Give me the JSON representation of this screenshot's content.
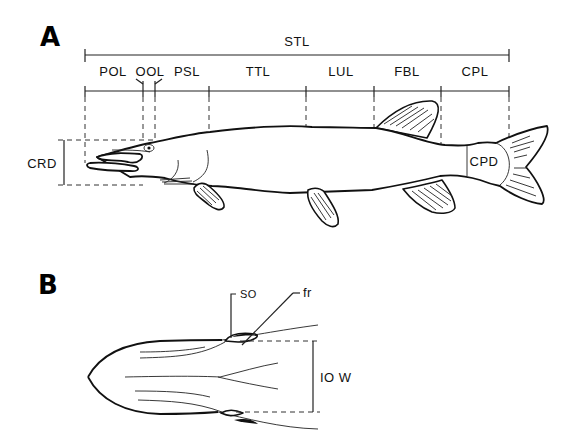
{
  "figure": {
    "panel_a": {
      "letter": "A",
      "total_label": "STL",
      "segments": [
        {
          "id": "pol",
          "label": "POL"
        },
        {
          "id": "ool",
          "label": "OOL"
        },
        {
          "id": "psl",
          "label": "PSL"
        },
        {
          "id": "ttl",
          "label": "TTL"
        },
        {
          "id": "lul",
          "label": "LUL"
        },
        {
          "id": "fbl",
          "label": "FBL"
        },
        {
          "id": "cpl",
          "label": "CPL"
        }
      ],
      "depth_label": "CRD",
      "peduncle_label": "CPD"
    },
    "panel_b": {
      "letter": "B",
      "so_label": "SO",
      "fr_label": "fr",
      "width_label": "IO W"
    }
  }
}
